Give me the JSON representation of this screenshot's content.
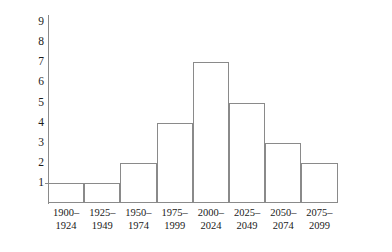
{
  "chart_data": {
    "type": "bar",
    "title": "",
    "subtitle": "",
    "xlabel": "",
    "ylabel": "Frequency",
    "categories": [
      "1900–1924",
      "1925–1949",
      "1950–1974",
      "1975–1999",
      "2000–2024",
      "2025–2049",
      "2050–2074",
      "2075–2099"
    ],
    "category_lines": [
      [
        "1900–",
        "1924"
      ],
      [
        "1925–",
        "1949"
      ],
      [
        "1950–",
        "1974"
      ],
      [
        "1975–",
        "1999"
      ],
      [
        "2000–",
        "2024"
      ],
      [
        "2025–",
        "2049"
      ],
      [
        "2050–",
        "2074"
      ],
      [
        "2075–",
        "2099"
      ]
    ],
    "values": [
      1,
      1,
      2,
      4,
      7,
      5,
      3,
      2
    ],
    "ylim": [
      0,
      9.4
    ],
    "yticks": [
      1,
      2,
      3,
      4,
      5,
      6,
      7,
      8,
      9
    ],
    "ytick_labels": [
      "1",
      "2",
      "3",
      "4",
      "5",
      "6",
      "7",
      "8",
      "9"
    ],
    "grid": false,
    "legend": null,
    "bar_fill_color": "#ffffff",
    "bar_edge_color": "#8a8a8a",
    "axis_color": "#8a8a8a",
    "text_color": "#1a1a1a"
  },
  "axes": {
    "y_title": "Frequency"
  }
}
